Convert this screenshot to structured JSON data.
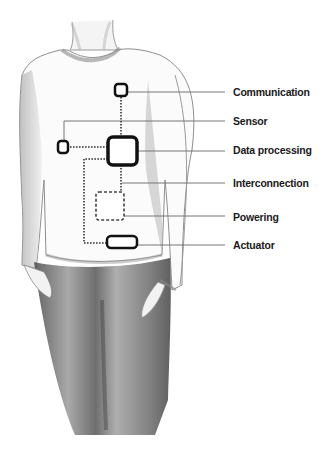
{
  "diagram": {
    "components": [
      {
        "id": "communication",
        "label": "Communication",
        "label_y": 86
      },
      {
        "id": "sensor",
        "label": "Sensor",
        "label_y": 115
      },
      {
        "id": "data_processing",
        "label": "Data processing",
        "label_y": 144
      },
      {
        "id": "interconnection",
        "label": "Interconnection",
        "label_y": 177
      },
      {
        "id": "powering",
        "label": "Powering",
        "label_y": 211
      },
      {
        "id": "actuator",
        "label": "Actuator",
        "label_y": 239
      }
    ],
    "colors": {
      "box_stroke": "#111111",
      "leader_line": "#777777",
      "dotted_connection": "#333333",
      "sketch_shading": "#8a8a8a",
      "pants_shading": "#5e5e5e"
    }
  }
}
